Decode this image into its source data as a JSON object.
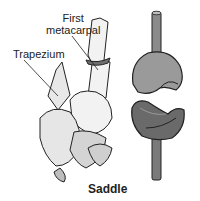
{
  "diagram": {
    "type": "anatomical-joint-illustration",
    "caption": "Saddle",
    "labels": {
      "first_metacarpal_line1": "First",
      "first_metacarpal_line2": "metacarpal",
      "trapezium": "Trapezium"
    },
    "colors": {
      "background": "#ffffff",
      "line": "#222222",
      "bone_fill": "#f2f2f2",
      "bone_shade": "#bdbdbd",
      "joint_surface": "#6e6e6e",
      "upper_saddle": "#9a9a9a",
      "lower_saddle": "#6a6a6a",
      "rod": "#7a7a7a"
    }
  }
}
